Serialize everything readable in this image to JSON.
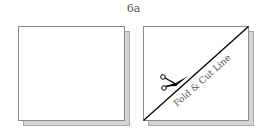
{
  "figure": {
    "label": "6a",
    "panels": [
      {
        "name": "plain-square",
        "description": "Square sheet of paper"
      },
      {
        "name": "folded-square",
        "description": "Square with diagonal fold line",
        "fold_line_label": "Fold & Cut Line",
        "icon": "scissors-icon"
      }
    ],
    "colors": {
      "paper": "#ffffff",
      "paper_border": "#8a8a8a",
      "shadow": "#d4d4d4",
      "line": "#000000",
      "text": "#555555"
    }
  }
}
